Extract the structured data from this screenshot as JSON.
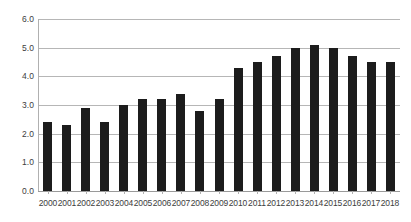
{
  "chart_data": {
    "type": "bar",
    "title": "",
    "subtitle": "",
    "xlabel": "",
    "ylabel": "",
    "categories": [
      "2000",
      "2001",
      "2002",
      "2003",
      "2004",
      "2005",
      "2006",
      "2007",
      "2008",
      "2009",
      "2010",
      "2011",
      "2012",
      "2013",
      "2014",
      "2015",
      "2016",
      "2017",
      "2018"
    ],
    "values": [
      2.4,
      2.3,
      2.9,
      2.4,
      3.0,
      3.2,
      3.2,
      3.4,
      2.8,
      3.2,
      4.3,
      4.5,
      4.7,
      5.0,
      5.1,
      5.0,
      4.7,
      4.5,
      4.5
    ],
    "ylim": [
      0.0,
      6.0
    ],
    "ytick_labels": [
      "0.0",
      "1.0",
      "2.0",
      "3.0",
      "4.0",
      "5.0",
      "6.0"
    ],
    "ytick_values": [
      0.0,
      1.0,
      2.0,
      3.0,
      4.0,
      5.0,
      6.0
    ],
    "grid": true,
    "grid_axis": "y",
    "legend": false,
    "legend_position": "none",
    "annotations": [],
    "colors": {
      "bar": "#1c1c1c",
      "gridline": "#b6b6b6",
      "axis": "#b0b0b0",
      "background": "#ffffff",
      "tick_label": "#3d3d3d"
    }
  }
}
